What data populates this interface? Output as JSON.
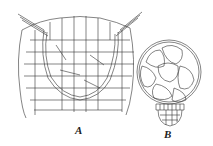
{
  "figure": {
    "panels": [
      {
        "id": "A",
        "label": "A",
        "description": "cross-section of tissue with embedded cup-shaped structure"
      },
      {
        "id": "B",
        "label": "B",
        "description": "spherical body of cells with basal cell cluster"
      }
    ],
    "colors": {
      "line": "#333333",
      "background": "#ffffff"
    }
  }
}
